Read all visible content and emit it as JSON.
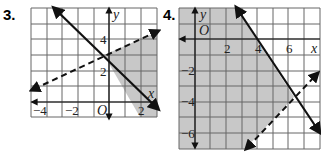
{
  "problems": [
    {
      "label": "3.",
      "graph": {
        "xrange": [
          -5,
          3
        ],
        "yrange": [
          -1,
          6
        ],
        "x_ticks": [
          {
            "v": -4,
            "t": "−4"
          },
          {
            "v": -2,
            "t": "−2"
          },
          {
            "v": 2,
            "t": "2"
          }
        ],
        "y_ticks": [
          {
            "v": 4,
            "t": "4"
          },
          {
            "v": 2,
            "t": "2"
          }
        ],
        "origin_label": "O",
        "x_label": "x",
        "y_label": "y",
        "lines": [
          {
            "style": "solid",
            "from": [
              -3.5,
              6.2
            ],
            "to": [
              3,
              -0.3
            ]
          },
          {
            "style": "dashed",
            "from": [
              -5,
              0.5
            ],
            "to": [
              3,
              4.5
            ]
          }
        ],
        "shaded_region": "right of solid line, below dashed line"
      }
    },
    {
      "label": "4.",
      "graph": {
        "xrange": [
          -1,
          8
        ],
        "yrange": [
          -7,
          2
        ],
        "x_ticks": [
          {
            "v": 2,
            "t": "2"
          },
          {
            "v": 4,
            "t": "4"
          },
          {
            "v": 6,
            "t": "6"
          }
        ],
        "y_ticks": [
          {
            "v": -2,
            "t": "−2"
          },
          {
            "v": -4,
            "t": "−4"
          },
          {
            "v": -6,
            "t": "−6"
          }
        ],
        "origin_label": "O",
        "x_label": "x",
        "y_label": "y",
        "lines": [
          {
            "style": "solid",
            "from": [
              2.7,
              2
            ],
            "to": [
              8.7,
              -7
            ]
          },
          {
            "style": "dashed",
            "from": [
              3.3,
              -7
            ],
            "to": [
              8,
              -2.5
            ]
          }
        ],
        "shaded_region": "left of solid line, above dashed line"
      }
    }
  ],
  "colors": {
    "shade": "#c8c8c8",
    "grid": "#555555",
    "line": "#111111"
  }
}
